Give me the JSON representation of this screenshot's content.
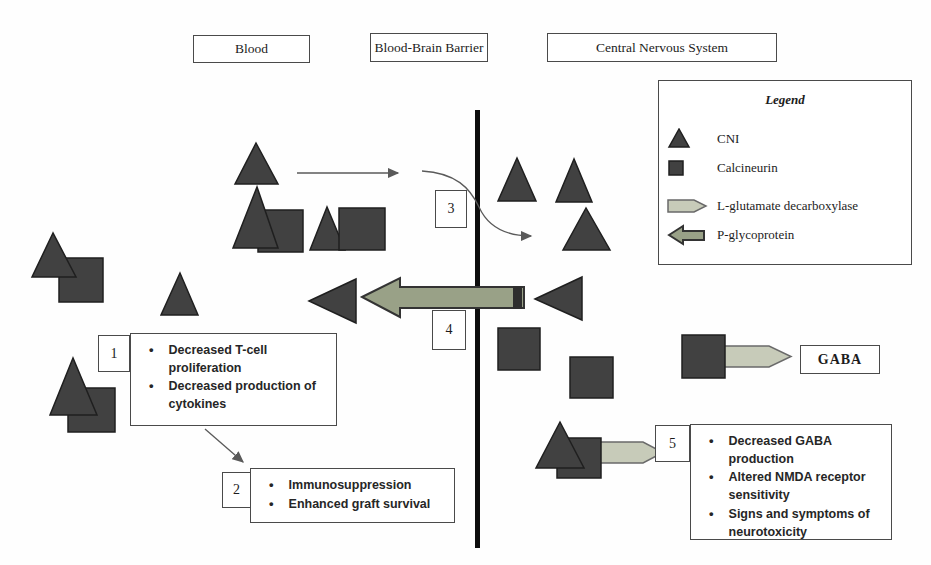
{
  "headers": {
    "blood": "Blood",
    "barrier": "Blood-Brain Barrier",
    "cns": "Central Nervous System"
  },
  "legend": {
    "title": "Legend",
    "items": [
      {
        "symbol": "cni-triangle",
        "label": "CNI"
      },
      {
        "symbol": "calcineurin-square",
        "label": "Calcineurin"
      },
      {
        "symbol": "right-block-arrow",
        "label": "L-glutamate decarboxylase"
      },
      {
        "symbol": "left-block-arrow",
        "label": "P-glycoprotein"
      }
    ]
  },
  "callouts": {
    "c1": {
      "number": "1",
      "bullets": [
        "Decreased T-cell proliferation",
        "Decreased production of cytokines"
      ]
    },
    "c2": {
      "number": "2",
      "bullets": [
        "Immunosuppression",
        "Enhanced graft survival"
      ]
    },
    "c3": {
      "number": "3"
    },
    "c4": {
      "number": "4"
    },
    "c5": {
      "number": "5",
      "bullets": [
        "Decreased GABA production",
        "Altered NMDA receptor sensitivity",
        "Signs and symptoms of neurotoxicity"
      ]
    }
  },
  "labels": {
    "gaba": "GABA"
  },
  "colors": {
    "shape_fill": "#414141",
    "shape_stroke": "#1f1f1f",
    "pgp_arrow_fill": "#99a187",
    "lglut_arrow_fill": "#c7cbb9",
    "barrier_line": "#0d0d0d",
    "thin_arrow": "#5a5a5a"
  }
}
